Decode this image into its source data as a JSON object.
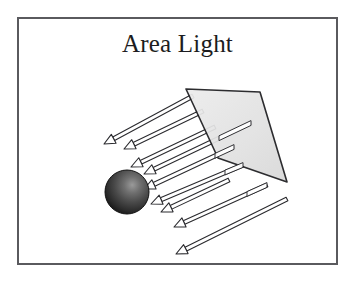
{
  "figure": {
    "title": "Area Light",
    "kind": "illustration",
    "background_color": "#ffffff",
    "frame": {
      "border_color": "#5a5a5e",
      "border_width_px": 2,
      "x": 17,
      "y": 17,
      "width": 321,
      "height": 248
    },
    "title_color": "#1c1c20",
    "title_font_size_px": 25
  },
  "scene": {
    "light_panel": {
      "label": "area-light-panel",
      "fill_color": "#e3e3e3",
      "stroke_color": "#1d1d20",
      "stroke_width_px": 1.6,
      "points": "167,70 241,73 268,163 199,139",
      "description": "quadrilateral emissive surface seen in perspective"
    },
    "sphere": {
      "label": "lit-sphere",
      "center_x": 108,
      "center_y": 173,
      "radius": 22,
      "base_color": "#3b3b3b",
      "highlight_color": "#8e8e8e",
      "shadow_color": "#141414",
      "outline_color": "#111111"
    },
    "arrows": {
      "label": "light-ray-arrows",
      "count": 9,
      "fill_color": "#ffffff",
      "stroke_color": "#2a2a2e",
      "shaft_thickness_px": 4,
      "head_length_px": 11,
      "head_width_px": 10,
      "direction": "toward lower-left",
      "rays": [
        {
          "x1": 174,
          "y1": 77,
          "x2": 85,
          "y2": 125
        },
        {
          "x1": 184,
          "y1": 92,
          "x2": 105,
          "y2": 130
        },
        {
          "x1": 196,
          "y1": 108,
          "x2": 112,
          "y2": 148
        },
        {
          "x1": 232,
          "y1": 104,
          "x2": 125,
          "y2": 155
        },
        {
          "x1": 215,
          "y1": 128,
          "x2": 125,
          "y2": 170
        },
        {
          "x1": 224,
          "y1": 146,
          "x2": 132,
          "y2": 185
        },
        {
          "x1": 210,
          "y1": 161,
          "x2": 142,
          "y2": 193
        },
        {
          "x1": 248,
          "y1": 166,
          "x2": 155,
          "y2": 208
        },
        {
          "x1": 268,
          "y1": 180,
          "x2": 157,
          "y2": 235
        }
      ]
    }
  }
}
